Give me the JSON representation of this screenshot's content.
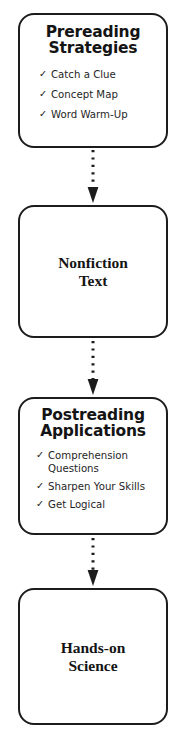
{
  "diagram": {
    "orientation": "vertical",
    "background_color": "#ffffff",
    "line_color": "#1c1c1c",
    "text_color": "#141414",
    "check_glyph": "✓",
    "nodes": [
      {
        "id": "prereading",
        "title": "Prereading\nStrategies",
        "title_style": "sans-bold",
        "items": [
          "Catch a Clue",
          "Concept Map",
          "Word Warm-Up"
        ]
      },
      {
        "id": "nonfiction",
        "title": "Nonfiction\nText",
        "title_style": "serif-bold",
        "items": []
      },
      {
        "id": "postreading",
        "title": "Postreading\nApplications",
        "title_style": "sans-bold",
        "items": [
          "Comprehension\nQuestions",
          "Sharpen Your Skills",
          "Get Logical"
        ]
      },
      {
        "id": "handson",
        "title": "Hands-on\nScience",
        "title_style": "serif-bold",
        "items": []
      }
    ],
    "connectors": [
      {
        "id": "connector-1",
        "from": "prereading",
        "to": "nonfiction",
        "style": "dotted",
        "arrowhead": "solid-triangle"
      },
      {
        "id": "connector-2",
        "from": "nonfiction",
        "to": "postreading",
        "style": "dotted",
        "arrowhead": "solid-triangle"
      },
      {
        "id": "connector-3",
        "from": "postreading",
        "to": "handson",
        "style": "dotted",
        "arrowhead": "solid-triangle"
      }
    ]
  }
}
